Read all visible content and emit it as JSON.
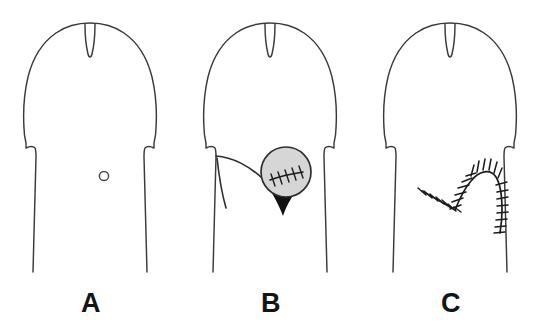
{
  "figure": {
    "background_color": "#ffffff",
    "ink_color": "#3a3a3a",
    "suture_color": "#1c1c1c",
    "graft_fill_color": "#d6d6d6",
    "wedge_fill_color": "#111111",
    "panel_count": 3
  },
  "panels": [
    {
      "id": "panel-a",
      "label": "A",
      "label_x": 91,
      "label_y": 312,
      "center_x": 90,
      "description": "Intact glans and shaft outline with a small ventral meatal opening",
      "features": [
        "organ-outline",
        "meatus-circle"
      ],
      "meatus": {
        "cx": 104,
        "cy": 176,
        "r": 4.6
      }
    },
    {
      "id": "panel-b",
      "label": "B",
      "label_x": 271,
      "label_y": 312,
      "center_x": 270,
      "description": "Circular graft with transverse sutures placed over the defect, dark triangular wedge below, curved flap incision at left",
      "features": [
        "organ-outline",
        "flap-line",
        "graft-disc",
        "graft-sutures",
        "wedge-fill"
      ],
      "graft": {
        "cx": 286,
        "cy": 172,
        "r": 25
      },
      "graft_suture_count": 5,
      "wedge": {
        "apex_x": 283,
        "apex_y": 216
      }
    },
    {
      "id": "panel-c",
      "label": "C",
      "label_x": 451,
      "label_y": 312,
      "center_x": 450,
      "description": "Completed closure showing a V-shaped suture line rising to a rounded arc and descending along the right shaft margin",
      "features": [
        "organ-outline",
        "suture-line"
      ],
      "suture_tick_count": 31
    }
  ],
  "labels": {
    "a": "A",
    "b": "B",
    "c": "C"
  }
}
